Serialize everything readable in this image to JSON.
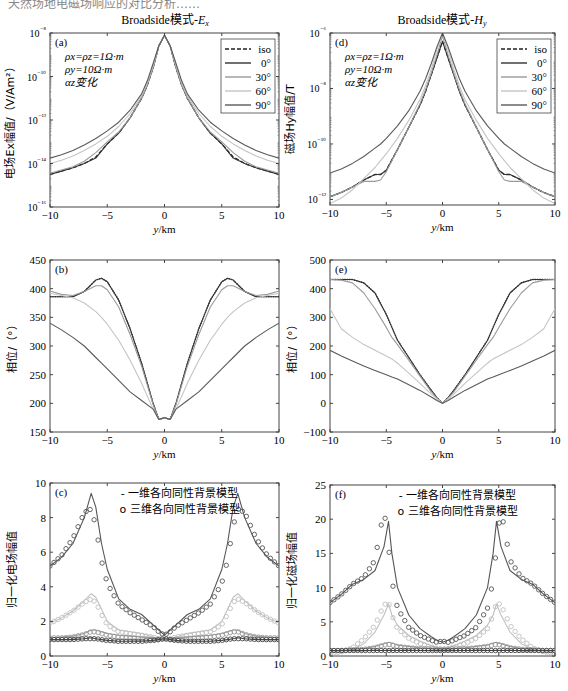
{
  "header_fragment": "天然场地电磁场响应的对比分析……",
  "columns": [
    {
      "title_prefix": "Broadside模式-",
      "title_var": "E",
      "title_sub": "x"
    },
    {
      "title_prefix": "Broadside模式-",
      "title_var": "H",
      "title_sub": "y"
    }
  ],
  "chart_data": [
    {
      "id": "a",
      "type": "line",
      "panel_label": "(a)",
      "title": "Broadside模式-Ex",
      "xlabel": "y/km",
      "ylabel": "电场Ex幅值/（V/Am²）",
      "yscale": "log",
      "xlim": [
        -10,
        10
      ],
      "ylim_exp": [
        -16,
        -8
      ],
      "xticks": [
        -10,
        -5,
        0,
        5,
        10
      ],
      "yticks_exp": [
        -8,
        -10,
        -12,
        -14,
        -16
      ],
      "annotation": [
        "ρx=ρz=1Ω·m",
        "ρy=10Ω·m",
        "αz变化"
      ],
      "legend": [
        "iso",
        "0°",
        "30°",
        "60°",
        "90°"
      ],
      "x": [
        0,
        0.5,
        1,
        1.5,
        2,
        3,
        4,
        5,
        6,
        7,
        8,
        9,
        10
      ],
      "series": [
        {
          "name": "iso",
          "style": "dashed",
          "color": "#222222",
          "log10": [
            -8.1,
            -8.6,
            -9.6,
            -10.4,
            -11.0,
            -11.9,
            -12.6,
            -13.1,
            -13.7,
            -14.0,
            -14.2,
            -14.35,
            -14.5
          ]
        },
        {
          "name": "0°",
          "style": "solid",
          "color": "#333333",
          "log10": [
            -8.1,
            -8.6,
            -9.6,
            -10.4,
            -11.0,
            -11.9,
            -12.6,
            -13.1,
            -13.75,
            -14.0,
            -14.2,
            -14.35,
            -14.5
          ]
        },
        {
          "name": "30°",
          "style": "solid",
          "color": "#9a9a9a",
          "log10": [
            -8.1,
            -8.6,
            -9.6,
            -10.4,
            -11.0,
            -11.9,
            -12.55,
            -13.0,
            -13.5,
            -13.9,
            -14.15,
            -14.3,
            -14.45
          ]
        },
        {
          "name": "60°",
          "style": "solid",
          "color": "#c4c4c4",
          "log10": [
            -8.1,
            -8.6,
            -9.5,
            -10.3,
            -10.9,
            -11.7,
            -12.3,
            -12.75,
            -13.1,
            -13.4,
            -13.65,
            -13.85,
            -14.0
          ]
        },
        {
          "name": "90°",
          "style": "solid",
          "color": "#5a5a5a",
          "log10": [
            -8.1,
            -8.6,
            -9.4,
            -10.2,
            -10.8,
            -11.55,
            -12.1,
            -12.5,
            -12.85,
            -13.15,
            -13.4,
            -13.6,
            -13.75
          ]
        }
      ]
    },
    {
      "id": "b",
      "type": "line",
      "panel_label": "(b)",
      "xlabel": "y/km",
      "ylabel": "相位/（°）",
      "xlim": [
        -10,
        10
      ],
      "ylim": [
        150,
        450
      ],
      "xticks": [
        -10,
        -5,
        0,
        5,
        10
      ],
      "yticks": [
        450,
        400,
        350,
        300,
        250,
        200,
        150
      ],
      "x": [
        0,
        0.5,
        1,
        2,
        3,
        4,
        5,
        5.5,
        6,
        7,
        8,
        9,
        10
      ],
      "series": [
        {
          "name": "iso",
          "style": "dotted",
          "color": "#222222",
          "values": [
            175,
            172,
            200,
            270,
            330,
            380,
            412,
            418,
            415,
            395,
            386,
            386,
            386
          ]
        },
        {
          "name": "0°",
          "style": "solid",
          "color": "#333333",
          "values": [
            175,
            172,
            200,
            270,
            330,
            380,
            412,
            418,
            415,
            395,
            386,
            386,
            386
          ]
        },
        {
          "name": "30°",
          "style": "solid",
          "color": "#9a9a9a",
          "values": [
            175,
            172,
            198,
            265,
            320,
            368,
            398,
            405,
            405,
            395,
            388,
            390,
            396
          ]
        },
        {
          "name": "60°",
          "style": "solid",
          "color": "#c4c4c4",
          "values": [
            175,
            172,
            190,
            235,
            275,
            310,
            338,
            350,
            360,
            375,
            384,
            388,
            392
          ]
        },
        {
          "name": "90°",
          "style": "solid",
          "color": "#5a5a5a",
          "values": [
            175,
            172,
            190,
            205,
            220,
            240,
            260,
            270,
            280,
            300,
            315,
            328,
            340
          ]
        }
      ]
    },
    {
      "id": "c",
      "type": "line",
      "panel_label": "(c)",
      "xlabel": "y/km",
      "ylabel": "归一化电场幅值",
      "xlim": [
        -10,
        10
      ],
      "ylim": [
        0,
        10
      ],
      "xticks": [
        -10,
        -5,
        0,
        5,
        10
      ],
      "yticks": [
        10,
        8,
        6,
        4,
        2,
        0
      ],
      "legend": [
        "- 一维各向同性背景模型",
        "o 三维各向同性背景模型"
      ],
      "x": [
        0,
        0.5,
        1,
        2,
        3,
        4,
        5,
        5.5,
        6,
        6.4,
        7,
        8,
        9,
        10
      ],
      "series": [
        {
          "name": "1D high",
          "style": "solid",
          "color": "#555555",
          "values": [
            1.2,
            1.5,
            1.8,
            2.4,
            2.7,
            3.3,
            5.0,
            6.5,
            8.6,
            9.4,
            8.0,
            6.5,
            5.7,
            5.2
          ]
        },
        {
          "name": "3D high",
          "style": "circles",
          "color": "#555555",
          "values": [
            1.2,
            1.4,
            1.7,
            2.1,
            2.5,
            3.0,
            4.2,
            5.5,
            7.5,
            8.5,
            8.3,
            6.8,
            5.8,
            5.2
          ]
        },
        {
          "name": "1D mid",
          "style": "solid",
          "color": "#c0c0c0",
          "values": [
            1.0,
            1.0,
            1.1,
            1.3,
            1.4,
            1.5,
            2.0,
            2.7,
            3.4,
            3.6,
            3.2,
            2.6,
            2.2,
            1.9
          ]
        },
        {
          "name": "3D mid",
          "style": "circles",
          "color": "#c0c0c0",
          "values": [
            1.0,
            1.0,
            1.1,
            1.2,
            1.3,
            1.4,
            1.8,
            2.4,
            3.1,
            3.3,
            3.1,
            2.6,
            2.2,
            1.9
          ]
        },
        {
          "name": "1D low",
          "style": "solid",
          "color": "#999999",
          "values": [
            1.0,
            1.0,
            1.05,
            1.1,
            1.15,
            1.2,
            1.3,
            1.4,
            1.5,
            1.5,
            1.3,
            1.15,
            1.1,
            1.05
          ]
        },
        {
          "name": "3D low",
          "style": "circles",
          "color": "#999999",
          "values": [
            1.0,
            0.95,
            0.95,
            1.0,
            1.05,
            1.1,
            1.2,
            1.3,
            1.4,
            1.4,
            1.25,
            1.1,
            1.05,
            1.05
          ]
        },
        {
          "name": "1D base",
          "style": "solid",
          "color": "#444444",
          "values": [
            1.0,
            0.95,
            0.9,
            0.85,
            0.85,
            0.85,
            0.9,
            0.95,
            1.0,
            1.05,
            1.0,
            0.95,
            0.95,
            0.95
          ]
        },
        {
          "name": "3D base",
          "style": "circles",
          "color": "#444444",
          "values": [
            1.0,
            0.95,
            0.9,
            0.85,
            0.85,
            0.85,
            0.9,
            0.95,
            1.0,
            1.0,
            1.0,
            0.95,
            0.95,
            0.95
          ]
        }
      ]
    },
    {
      "id": "d",
      "type": "line",
      "panel_label": "(d)",
      "title": "Broadside模式-Hy",
      "xlabel": "y/km",
      "ylabel": "磁场Hy幅值/T",
      "yscale": "log",
      "xlim": [
        -10,
        10
      ],
      "ylim_exp": [
        -12.2,
        -6
      ],
      "xticks": [
        -10,
        -5,
        0,
        5,
        10
      ],
      "yticks_exp": [
        -6,
        -8,
        -10,
        -12
      ],
      "annotation": [
        "ρx=ρz=1Ω·m",
        "ρy=10Ω·m",
        "αz变化"
      ],
      "legend": [
        "iso",
        "0°",
        "30°",
        "60°",
        "90°"
      ],
      "x": [
        0,
        0.5,
        1,
        1.5,
        2,
        3,
        4,
        5,
        5.5,
        6,
        7,
        8,
        9,
        10
      ],
      "series": [
        {
          "name": "iso",
          "style": "dashed",
          "color": "#222222",
          "log10": [
            -6.3,
            -6.9,
            -7.5,
            -8.1,
            -8.6,
            -9.4,
            -10.2,
            -10.95,
            -11.1,
            -11.1,
            -11.3,
            -11.55,
            -11.75,
            -11.9
          ]
        },
        {
          "name": "0°",
          "style": "solid",
          "color": "#333333",
          "log10": [
            -6.3,
            -6.9,
            -7.5,
            -8.1,
            -8.6,
            -9.4,
            -10.2,
            -10.95,
            -11.1,
            -11.1,
            -11.3,
            -11.55,
            -11.75,
            -11.9
          ]
        },
        {
          "name": "30°",
          "style": "solid",
          "color": "#9a9a9a",
          "log10": [
            -6.1,
            -6.8,
            -7.45,
            -8.05,
            -8.55,
            -9.4,
            -10.2,
            -11.0,
            -11.3,
            -11.35,
            -11.35,
            -11.55,
            -11.75,
            -11.9
          ]
        },
        {
          "name": "60°",
          "style": "solid",
          "color": "#c4c4c4",
          "log10": [
            -6.0,
            -6.6,
            -7.3,
            -7.9,
            -8.4,
            -9.15,
            -9.8,
            -10.35,
            -10.6,
            -10.85,
            -11.25,
            -11.65,
            -11.95,
            -12.15
          ]
        },
        {
          "name": "90°",
          "style": "solid",
          "color": "#5a5a5a",
          "log10": [
            -6.0,
            -6.5,
            -7.1,
            -7.65,
            -8.1,
            -8.8,
            -9.35,
            -9.8,
            -10.0,
            -10.15,
            -10.45,
            -10.7,
            -10.9,
            -11.05
          ]
        }
      ]
    },
    {
      "id": "e",
      "type": "line",
      "panel_label": "(e)",
      "xlabel": "y/km",
      "ylabel": "相位/（°）",
      "xlim": [
        -10,
        10
      ],
      "ylim": [
        -100,
        500
      ],
      "xticks": [
        -10,
        -5,
        0,
        5,
        10
      ],
      "yticks": [
        500,
        400,
        300,
        200,
        100,
        0,
        -100
      ],
      "x": [
        0,
        0.5,
        1,
        2,
        3,
        4,
        4.5,
        5,
        6,
        7,
        8,
        9,
        10
      ],
      "series": [
        {
          "name": "iso",
          "style": "dotted",
          "color": "#222222",
          "values": [
            0,
            20,
            45,
            100,
            160,
            220,
            265,
            310,
            385,
            420,
            432,
            432,
            432
          ]
        },
        {
          "name": "0°",
          "style": "solid",
          "color": "#333333",
          "values": [
            0,
            20,
            45,
            100,
            160,
            220,
            265,
            310,
            385,
            420,
            432,
            432,
            432
          ]
        },
        {
          "name": "30°",
          "style": "solid",
          "color": "#9a9a9a",
          "values": [
            0,
            18,
            40,
            95,
            150,
            205,
            230,
            265,
            330,
            385,
            420,
            430,
            432
          ]
        },
        {
          "name": "60°",
          "style": "solid",
          "color": "#c4c4c4",
          "values": [
            0,
            15,
            32,
            70,
            105,
            140,
            155,
            165,
            185,
            205,
            230,
            260,
            330
          ]
        },
        {
          "name": "90°",
          "style": "solid",
          "color": "#5a5a5a",
          "values": [
            0,
            10,
            22,
            45,
            65,
            85,
            92,
            100,
            115,
            130,
            148,
            165,
            185
          ]
        }
      ]
    },
    {
      "id": "f",
      "type": "line",
      "panel_label": "(f)",
      "xlabel": "y/km",
      "ylabel": "归一化磁场幅值",
      "xlim": [
        -10,
        10
      ],
      "ylim": [
        0,
        25
      ],
      "xticks": [
        -10,
        -5,
        0,
        5,
        10
      ],
      "yticks": [
        25,
        20,
        15,
        10,
        5,
        0
      ],
      "legend": [
        "- 一维各向同性背景模型",
        "o 三维各向同性背景模型"
      ],
      "x": [
        0,
        0.5,
        1,
        2,
        3,
        4,
        4.5,
        4.8,
        5.2,
        6,
        7,
        8,
        9,
        10
      ],
      "series": [
        {
          "name": "1D high",
          "style": "solid",
          "color": "#555555",
          "values": [
            2.0,
            2.3,
            2.8,
            4.0,
            6.0,
            10.0,
            15.0,
            19.7,
            16.0,
            12.5,
            11.2,
            10.5,
            9.0,
            7.8
          ]
        },
        {
          "name": "3D high",
          "style": "circles",
          "color": "#555555",
          "values": [
            2.2,
            2.0,
            2.3,
            3.0,
            4.2,
            7.0,
            11.0,
            16.0,
            21.5,
            14.0,
            11.5,
            10.5,
            9.0,
            7.8
          ]
        },
        {
          "name": "1D mid",
          "style": "solid",
          "color": "#c0c0c0",
          "values": [
            1.0,
            1.2,
            1.5,
            2.2,
            3.0,
            4.5,
            6.0,
            7.6,
            6.0,
            3.5,
            1.8,
            1.0,
            0.7,
            0.6
          ]
        },
        {
          "name": "3D mid",
          "style": "circles",
          "color": "#c0c0c0",
          "values": [
            1.0,
            1.1,
            1.3,
            1.8,
            2.6,
            4.0,
            6.0,
            7.8,
            7.5,
            4.5,
            2.5,
            1.2,
            0.6,
            0.4
          ]
        },
        {
          "name": "1D low",
          "style": "solid",
          "color": "#999999",
          "values": [
            1.0,
            1.0,
            1.1,
            1.2,
            1.4,
            1.6,
            1.9,
            2.0,
            1.8,
            1.4,
            1.1,
            0.9,
            0.8,
            0.8
          ]
        },
        {
          "name": "3D low",
          "style": "circles",
          "color": "#999999",
          "values": [
            1.0,
            1.0,
            1.05,
            1.1,
            1.2,
            1.4,
            1.6,
            1.7,
            1.6,
            1.2,
            1.0,
            0.9,
            0.8,
            0.8
          ]
        },
        {
          "name": "1D base",
          "style": "solid",
          "color": "#444444",
          "values": [
            0.8,
            0.8,
            0.8,
            0.8,
            0.8,
            0.8,
            0.8,
            0.85,
            0.8,
            0.8,
            0.8,
            0.8,
            0.8,
            0.8
          ]
        },
        {
          "name": "3D base",
          "style": "circles",
          "color": "#444444",
          "values": [
            0.8,
            0.8,
            0.8,
            0.8,
            0.8,
            0.8,
            0.8,
            0.8,
            0.8,
            0.8,
            0.8,
            0.8,
            0.8,
            0.8
          ]
        }
      ]
    }
  ]
}
